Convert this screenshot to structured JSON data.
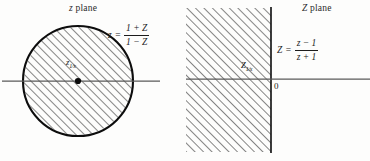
{
  "figure": {
    "width": 370,
    "height": 161,
    "background": "#fdfdfc",
    "ink": "#1a1a1a",
    "hatch_color": "#2b2b2b",
    "axis_color": "#555555"
  },
  "left_panel": {
    "title_var": "z",
    "title_word": "plane",
    "region_shape": "filled-disk",
    "region_description": "shaded unit disk interior",
    "formula": {
      "lhs": "z",
      "equals": "=",
      "numerator_terms": [
        "1",
        "+",
        "Z"
      ],
      "denominator_terms": [
        "1",
        "−",
        "Z"
      ],
      "numerator_text": "1 + Z",
      "denominator_text": "1 − Z"
    },
    "point": {
      "base": "z",
      "subscript": "1⁄x",
      "marker": "filled-dot"
    },
    "circle": {
      "cx": 78,
      "cy": 81,
      "r": 55
    },
    "axis": {
      "y": 81,
      "x_start": 2,
      "x_end": 160
    }
  },
  "right_panel": {
    "title_var": "Z",
    "title_word": "plane",
    "region_shape": "half-plane",
    "region_description": "shaded left half-plane",
    "formula": {
      "lhs": "Z",
      "equals": "=",
      "numerator_terms": [
        "z",
        "−",
        "1"
      ],
      "denominator_terms": [
        "z",
        "+",
        "1"
      ],
      "numerator_text": "z − 1",
      "denominator_text": "z + 1"
    },
    "point": {
      "base": "Z",
      "subscript": "1⁄x",
      "marker": "none"
    },
    "origin_label": "0",
    "region_bounds": {
      "x": 186,
      "y": 8,
      "width": 85,
      "height": 144
    },
    "boundary_line_x": 271,
    "axis": {
      "y": 79,
      "x_start": 186,
      "x_end": 370
    }
  }
}
